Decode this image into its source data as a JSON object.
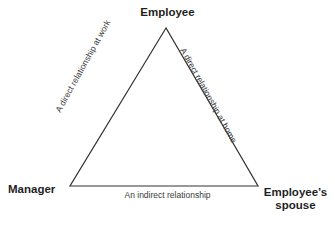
{
  "diagram": {
    "type": "triangle-relationship-diagram",
    "stroke_color": "#333333",
    "text_color": "#1f1f1f",
    "background_color": "#ffffff",
    "vertices": [
      {
        "id": "employee",
        "label": "Employee",
        "position": "top"
      },
      {
        "id": "manager",
        "label": "Manager",
        "position": "bottom-left"
      },
      {
        "id": "employee-spouse",
        "label": "Employee’s spouse",
        "position": "bottom-right"
      }
    ],
    "edges": [
      {
        "id": "manager-employee",
        "label": "A direct relationship at work",
        "side": "left"
      },
      {
        "id": "employee-spouse-edge",
        "label": "A direct relationship at home",
        "side": "right"
      },
      {
        "id": "manager-spouse",
        "label": "An indirect relationship",
        "side": "bottom"
      }
    ]
  }
}
